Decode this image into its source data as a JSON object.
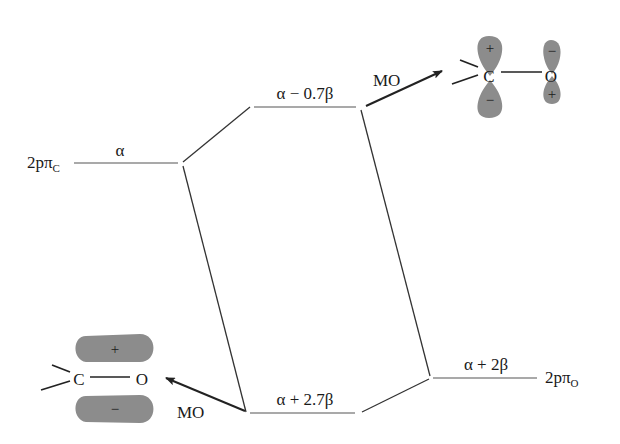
{
  "diagram": {
    "type": "molecular-orbital-energy-diagram",
    "atomic_orbitals": {
      "carbon": {
        "label_main": "2pπ",
        "label_sub": "C",
        "energy": "α"
      },
      "oxygen": {
        "label_main": "2pπ",
        "label_sub": "O",
        "energy": "α + 2β"
      }
    },
    "molecular_orbitals": {
      "antibonding": {
        "energy": "α − 0.7β",
        "arrow_label": "MO"
      },
      "bonding": {
        "energy": "α + 2.7β",
        "arrow_label": "MO"
      }
    },
    "orbital_pictures": {
      "antibonding": {
        "atoms": [
          "C",
          "O"
        ],
        "carbon_lobes": {
          "top": "+",
          "bottom": "−"
        },
        "oxygen_lobes": {
          "top": "−",
          "bottom": "+"
        }
      },
      "bonding": {
        "atoms": [
          "C",
          "O"
        ],
        "lobes": {
          "top": "+",
          "bottom": "−"
        }
      }
    },
    "colors": {
      "lines": "#333333",
      "lobe_fill": "#8c8c8c",
      "background": "#ffffff"
    }
  }
}
